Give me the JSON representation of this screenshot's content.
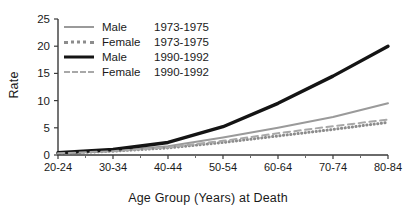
{
  "chart_data": {
    "type": "line",
    "title": "",
    "xlabel": "Age Group (Years) at Death",
    "ylabel": "Rate",
    "categories": [
      "20-24",
      "30-34",
      "40-44",
      "50-54",
      "60-64",
      "70-74",
      "80-84"
    ],
    "x_minor_ticks": [
      "25-29",
      "35-39",
      "45-49",
      "55-59",
      "65-69",
      "75-79"
    ],
    "ylim": [
      0,
      25
    ],
    "yticks": [
      0,
      5,
      10,
      15,
      20,
      25
    ],
    "grid": false,
    "legend_position": "top-left",
    "series": [
      {
        "name": "Male",
        "period": "1973-1975",
        "label": "Male 1973-1975",
        "style": "solid",
        "color": "#9a9a9a",
        "width": 2,
        "values": [
          0.3,
          0.8,
          1.6,
          3.2,
          5.0,
          7.0,
          9.5
        ]
      },
      {
        "name": "Female",
        "period": "1973-1975",
        "label": "Female 1973-1975",
        "style": "dotted",
        "color": "#8c8c8c",
        "width": 3,
        "values": [
          0.3,
          0.7,
          1.3,
          2.3,
          3.5,
          4.7,
          6.0
        ]
      },
      {
        "name": "Male",
        "period": "1990-1992",
        "label": "Male 1990-1992",
        "style": "solid",
        "color": "#141414",
        "width": 3.4,
        "values": [
          0.4,
          1.0,
          2.3,
          5.2,
          9.5,
          14.5,
          20.0
        ]
      },
      {
        "name": "Female",
        "period": "1990-1992",
        "label": "Female 1990-1992",
        "style": "dashed",
        "color": "#a8a8a8",
        "width": 2,
        "values": [
          0.3,
          0.7,
          1.4,
          2.6,
          4.0,
          5.3,
          6.5
        ]
      }
    ]
  },
  "legend": {
    "rows": [
      {
        "name": "Male",
        "period": "1973-1975"
      },
      {
        "name": "Female",
        "period": "1973-1975"
      },
      {
        "name": "Male",
        "period": "1990-1992"
      },
      {
        "name": "Female",
        "period": "1990-1992"
      }
    ]
  }
}
